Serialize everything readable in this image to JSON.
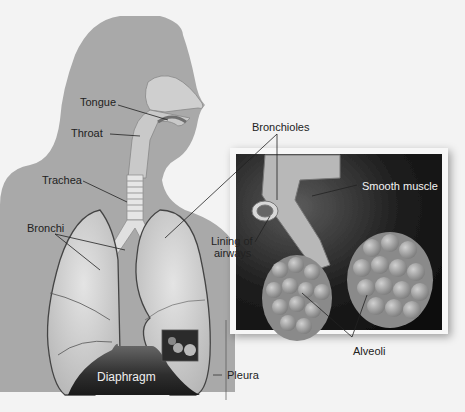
{
  "diagram": {
    "labels": {
      "tongue": "Tongue",
      "throat": "Throat",
      "trachea": "Trachea",
      "bronchi": "Bronchi",
      "bronchioles": "Bronchioles",
      "smooth_muscle": "Smooth muscle",
      "lining_line1": "Lining of",
      "lining_line2": "airways",
      "alveoli": "Alveoli",
      "diaphragm": "Diaphragm",
      "pleura": "Pleura"
    },
    "colors": {
      "background": "#f3f3f3",
      "body_silhouette": "#a9a9a9",
      "lung": "#cfcfcf",
      "diaphragm": "#3a3a3a",
      "inset_bg": "#1a1a1a",
      "alveoli": "#9a9a9a"
    }
  }
}
